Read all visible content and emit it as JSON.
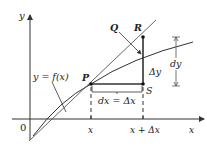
{
  "diagram": {
    "axes": {
      "y_label": "y",
      "x_label": "x",
      "origin_label": "0"
    },
    "curve_label": "y = f(x)",
    "points": {
      "P": "P",
      "Q": "Q",
      "R": "R",
      "S": "S"
    },
    "x_ticks": [
      "x",
      "x + Δx"
    ],
    "dx_label": "dx = Δx",
    "delta_y_label": "Δy",
    "dy_label": "dy",
    "colors": {
      "line": "#333333",
      "background": "#ffffff"
    }
  }
}
